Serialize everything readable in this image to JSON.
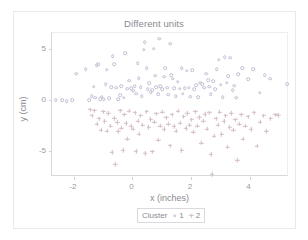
{
  "chart_data": {
    "type": "scatter",
    "title": "Different units",
    "xlabel": "x (inches)",
    "ylabel": "y (cm)",
    "xlim": [
      -2.75,
      5.35
    ],
    "ylim": [
      -7.6,
      6.6
    ],
    "grid": false,
    "legend_position": "bottom",
    "legend_title": "Cluster",
    "xticks": [
      -2,
      0,
      2,
      4
    ],
    "xtick_labels": [
      "-2",
      "0",
      "2",
      "4"
    ],
    "yticks": [
      5,
      0,
      -5
    ],
    "ytick_labels": [
      "5",
      "0",
      "-5"
    ],
    "series": [
      {
        "name": "1",
        "marker": "open-circle",
        "color": "#c3bcd2",
        "points": [
          [
            -2.62,
            -0.05
          ],
          [
            -2.4,
            -0.05
          ],
          [
            -2.25,
            -0.1
          ],
          [
            -2.05,
            0.0
          ],
          [
            -1.92,
            2.6
          ],
          [
            -1.6,
            3.05
          ],
          [
            -1.48,
            -0.05
          ],
          [
            -1.4,
            0.35
          ],
          [
            -1.32,
            1.3
          ],
          [
            -1.28,
            0.2
          ],
          [
            -1.22,
            3.45
          ],
          [
            -1.18,
            3.55
          ],
          [
            -1.1,
            0.05
          ],
          [
            -1.05,
            0.3
          ],
          [
            -0.98,
            0.1
          ],
          [
            -0.92,
            1.55
          ],
          [
            -0.88,
            3.0
          ],
          [
            -0.8,
            0.15
          ],
          [
            -0.72,
            1.25
          ],
          [
            -0.68,
            4.3
          ],
          [
            -0.62,
            3.55
          ],
          [
            -0.55,
            1.2
          ],
          [
            -0.48,
            0.05
          ],
          [
            -0.42,
            0.45
          ],
          [
            -0.38,
            1.35
          ],
          [
            -0.3,
            0.2
          ],
          [
            -0.25,
            4.6
          ],
          [
            -0.18,
            1.1
          ],
          [
            -0.12,
            1.9
          ],
          [
            -0.05,
            1.15
          ],
          [
            0.02,
            0.9
          ],
          [
            0.08,
            1.35
          ],
          [
            0.12,
            0.6
          ],
          [
            0.18,
            3.6
          ],
          [
            0.22,
            2.15
          ],
          [
            0.28,
            1.25
          ],
          [
            0.32,
            0.35
          ],
          [
            0.38,
            4.95
          ],
          [
            0.42,
            5.7
          ],
          [
            0.48,
            3.1
          ],
          [
            0.52,
            1.05
          ],
          [
            0.58,
            1.65
          ],
          [
            0.62,
            0.75
          ],
          [
            0.68,
            0.95
          ],
          [
            0.72,
            5.05
          ],
          [
            0.78,
            2.4
          ],
          [
            0.82,
            1.25
          ],
          [
            0.88,
            0.55
          ],
          [
            0.92,
            6.05
          ],
          [
            0.95,
            1.35
          ],
          [
            1.02,
            1.05
          ],
          [
            1.08,
            2.3
          ],
          [
            1.12,
            3.1
          ],
          [
            1.18,
            1.2
          ],
          [
            1.22,
            0.5
          ],
          [
            1.28,
            5.55
          ],
          [
            1.32,
            2.45
          ],
          [
            1.38,
            2.1
          ],
          [
            1.42,
            1.15
          ],
          [
            1.48,
            0.35
          ],
          [
            1.55,
            1.8
          ],
          [
            1.62,
            1.1
          ],
          [
            1.68,
            3.1
          ],
          [
            1.72,
            0.6
          ],
          [
            1.78,
            1.15
          ],
          [
            1.85,
            2.9
          ],
          [
            1.92,
            1.2
          ],
          [
            1.98,
            0.3
          ],
          [
            2.05,
            2.95
          ],
          [
            2.12,
            1.05
          ],
          [
            2.18,
            1.45
          ],
          [
            2.25,
            0.25
          ],
          [
            2.32,
            1.7
          ],
          [
            2.38,
            1.55
          ],
          [
            2.45,
            1.2
          ],
          [
            2.52,
            2.6
          ],
          [
            2.58,
            1.95
          ],
          [
            2.62,
            1.3
          ],
          [
            2.68,
            0.55
          ],
          [
            2.75,
            1.85
          ],
          [
            2.82,
            1.05
          ],
          [
            2.88,
            3.05
          ],
          [
            2.95,
            3.95
          ],
          [
            3.02,
            1.5
          ],
          [
            3.08,
            0.25
          ],
          [
            3.15,
            4.2
          ],
          [
            3.22,
            1.7
          ],
          [
            3.28,
            2.35
          ],
          [
            3.35,
            4.15
          ],
          [
            3.42,
            0.95
          ],
          [
            3.48,
            1.4
          ],
          [
            3.55,
            0.2
          ],
          [
            3.62,
            2.55
          ],
          [
            3.75,
            3.1
          ],
          [
            3.95,
            2.05
          ],
          [
            4.12,
            3.05
          ],
          [
            4.35,
            0.7
          ],
          [
            4.52,
            2.45
          ],
          [
            4.7,
            2.1
          ],
          [
            5.28,
            1.55
          ]
        ]
      },
      {
        "name": "2",
        "marker": "plus",
        "color": "#d3bcc4",
        "points": [
          [
            -1.45,
            -0.95
          ],
          [
            -1.38,
            -1.55
          ],
          [
            -1.3,
            -1.05
          ],
          [
            -1.22,
            -2.35
          ],
          [
            -1.15,
            -1.85
          ],
          [
            -1.08,
            -2.95
          ],
          [
            -1.0,
            -1.15
          ],
          [
            -0.95,
            -2.1
          ],
          [
            -0.88,
            -3.05
          ],
          [
            -0.82,
            -1.3
          ],
          [
            -0.75,
            -2.55
          ],
          [
            -0.7,
            -5.15
          ],
          [
            -0.62,
            -1.8
          ],
          [
            -0.58,
            -6.35
          ],
          [
            -0.52,
            -2.2
          ],
          [
            -0.48,
            -3.1
          ],
          [
            -0.42,
            -1.05
          ],
          [
            -0.38,
            -2.75
          ],
          [
            -0.32,
            -4.95
          ],
          [
            -0.28,
            -1.45
          ],
          [
            -0.22,
            -2.3
          ],
          [
            -0.18,
            -3.85
          ],
          [
            -0.12,
            -1.1
          ],
          [
            -0.05,
            -2.6
          ],
          [
            0.02,
            -2.85
          ],
          [
            0.08,
            -1.25
          ],
          [
            0.12,
            -5.05
          ],
          [
            0.18,
            -2.05
          ],
          [
            0.22,
            -3.35
          ],
          [
            0.28,
            -1.55
          ],
          [
            0.35,
            -2.45
          ],
          [
            0.42,
            -5.25
          ],
          [
            0.48,
            -1.15
          ],
          [
            0.55,
            -2.7
          ],
          [
            0.62,
            -1.9
          ],
          [
            0.68,
            -5.1
          ],
          [
            0.75,
            -2.15
          ],
          [
            0.82,
            -1.35
          ],
          [
            0.88,
            -3.95
          ],
          [
            0.95,
            -2.55
          ],
          [
            1.02,
            -1.2
          ],
          [
            1.08,
            -2.9
          ],
          [
            1.15,
            -1.75
          ],
          [
            1.22,
            -2.35
          ],
          [
            1.28,
            -4.5
          ],
          [
            1.35,
            -1.45
          ],
          [
            1.42,
            -2.6
          ],
          [
            1.48,
            -3.05
          ],
          [
            1.55,
            -1.1
          ],
          [
            1.62,
            -2.25
          ],
          [
            1.68,
            -4.95
          ],
          [
            1.75,
            -1.65
          ],
          [
            1.82,
            -2.8
          ],
          [
            1.88,
            -1.3
          ],
          [
            1.95,
            -2.45
          ],
          [
            2.02,
            -1.95
          ],
          [
            2.08,
            -3.15
          ],
          [
            2.15,
            -1.15
          ],
          [
            2.22,
            -2.55
          ],
          [
            2.28,
            -1.7
          ],
          [
            2.35,
            -4.25
          ],
          [
            2.42,
            -2.05
          ],
          [
            2.48,
            -1.4
          ],
          [
            2.55,
            -2.85
          ],
          [
            2.62,
            -1.25
          ],
          [
            2.68,
            -5.35
          ],
          [
            2.72,
            -7.35
          ],
          [
            2.78,
            -3.55
          ],
          [
            2.85,
            -1.85
          ],
          [
            2.92,
            -2.45
          ],
          [
            2.98,
            -1.2
          ],
          [
            3.05,
            -3.4
          ],
          [
            3.12,
            -2.1
          ],
          [
            3.18,
            -1.55
          ],
          [
            3.25,
            -4.65
          ],
          [
            3.32,
            -2.7
          ],
          [
            3.38,
            -1.3
          ],
          [
            3.45,
            -2.95
          ],
          [
            3.52,
            -1.95
          ],
          [
            3.58,
            -5.95
          ],
          [
            3.65,
            -2.35
          ],
          [
            3.72,
            -1.45
          ],
          [
            3.78,
            -3.85
          ],
          [
            3.85,
            -2.55
          ],
          [
            3.95,
            -1.65
          ],
          [
            4.05,
            -2.9
          ],
          [
            4.15,
            -1.25
          ],
          [
            4.25,
            -4.55
          ],
          [
            4.35,
            -2.15
          ],
          [
            4.48,
            -1.55
          ],
          [
            4.58,
            -3.1
          ],
          [
            4.72,
            -1.85
          ],
          [
            4.88,
            -1.45
          ],
          [
            4.98,
            -1.5
          ]
        ]
      }
    ]
  }
}
